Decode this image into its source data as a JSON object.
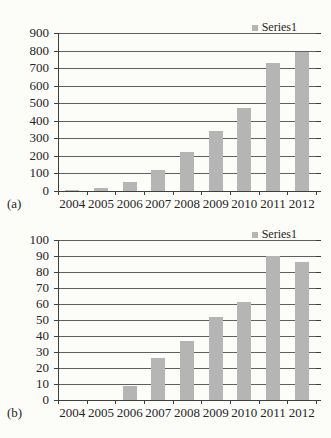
{
  "colors": {
    "background": "#fcfcf9",
    "bar": "#b5b5b5",
    "gridline": "#5f5f5f",
    "axis": "#3f3f3f",
    "text": "#262626"
  },
  "chart_data": [
    {
      "type": "bar",
      "panel_label": "(a)",
      "title": "",
      "legend": "Series1",
      "legend_position": "top-right",
      "grid": true,
      "categories": [
        "2004",
        "2005",
        "2006",
        "2007",
        "2008",
        "2009",
        "2010",
        "2011",
        "2012"
      ],
      "values": [
        5,
        15,
        50,
        120,
        225,
        340,
        475,
        730,
        790
      ],
      "xlabel": "",
      "ylabel": "",
      "ylim": [
        0,
        900
      ],
      "ytick_step": 100
    },
    {
      "type": "bar",
      "panel_label": "(b)",
      "title": "",
      "legend": "Series1",
      "legend_position": "top-right",
      "grid": true,
      "categories": [
        "2004",
        "2005",
        "2006",
        "2007",
        "2008",
        "2009",
        "2010",
        "2011",
        "2012"
      ],
      "values": [
        0,
        0,
        9,
        26,
        37,
        52,
        61,
        90,
        86
      ],
      "xlabel": "",
      "ylabel": "",
      "ylim": [
        0,
        100
      ],
      "ytick_step": 10
    }
  ]
}
